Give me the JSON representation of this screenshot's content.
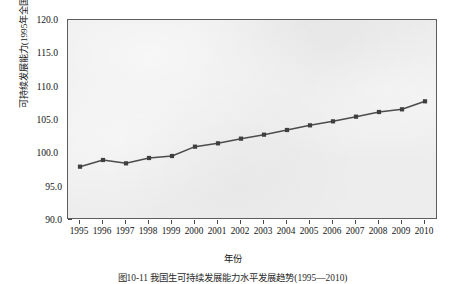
{
  "chart_data": {
    "type": "line",
    "title": "",
    "xlabel": "年份",
    "ylabel": "可持续发展能力(1995年全国为100)",
    "categories": [
      "1995",
      "1996",
      "1997",
      "1998",
      "1999",
      "2000",
      "2001",
      "2002",
      "2003",
      "2004",
      "2005",
      "2006",
      "2007",
      "2008",
      "2009",
      "2010"
    ],
    "values": [
      98.0,
      99.0,
      98.5,
      99.3,
      99.6,
      101.0,
      101.5,
      102.2,
      102.8,
      103.5,
      104.2,
      104.8,
      105.5,
      106.2,
      106.6,
      107.8
    ],
    "series": [
      {
        "name": "可持续发展能力",
        "values": [
          98.0,
          99.0,
          98.5,
          99.3,
          99.6,
          101.0,
          101.5,
          102.2,
          102.8,
          103.5,
          104.2,
          104.8,
          105.5,
          106.2,
          106.6,
          107.8
        ]
      }
    ],
    "ylim": [
      90.0,
      120.0
    ],
    "ytick_labels": [
      "90.0",
      "95.0",
      "100.0",
      "105.0",
      "110.0",
      "115.0",
      "120.0"
    ],
    "ytick_values": [
      90.0,
      95.0,
      100.0,
      105.0,
      110.0,
      115.0,
      120.0
    ],
    "xtick_labels": [
      "1995",
      "1996",
      "1997",
      "1998",
      "1999",
      "2000",
      "2001",
      "2002",
      "2003",
      "2004",
      "2005",
      "2006",
      "2007",
      "2008",
      "2009",
      "2010"
    ],
    "grid": false,
    "legend": false,
    "marker": "square",
    "line_color": "#4c4c4c",
    "marker_color": "#3f3f3f",
    "plot_background": "#ededed"
  },
  "figure": {
    "caption": "图10-11  我国生可持续发展能力水平发展趋势(1995—2010)"
  }
}
